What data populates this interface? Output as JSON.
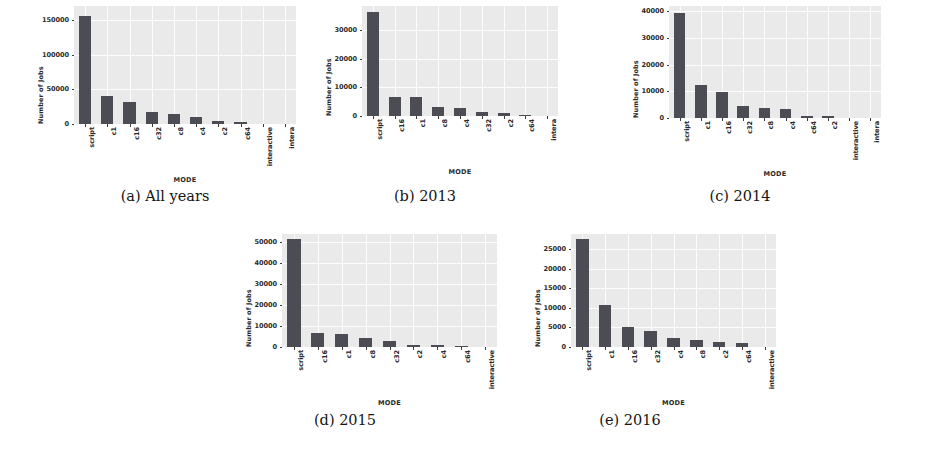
{
  "figure": {
    "panel_count": 5,
    "bar_color": "#4c4c54",
    "plot_background": "#eaeaea",
    "grid_color": "#fdfdfd",
    "text_color": "#2a2a2a"
  },
  "captions": {
    "a": "(a)  All years",
    "b": "(b)  2013",
    "c": "(c)  2014",
    "d": "(d)  2015",
    "e": "(e)  2016"
  },
  "axis_titles": {
    "y": "Number of Jobs",
    "x": "MODE"
  },
  "chart_data": [
    {
      "type": "bar",
      "title": "(a)  All years",
      "xlabel": "MODE",
      "ylabel": "Number of Jobs",
      "categories": [
        "script",
        "c1",
        "c16",
        "c32",
        "c8",
        "c4",
        "c2",
        "c64",
        "interactive",
        "intera"
      ],
      "values": [
        155000,
        40000,
        31000,
        17000,
        14000,
        10000,
        5000,
        2500,
        0,
        0
      ],
      "yticks": [
        0,
        50000,
        100000,
        150000
      ],
      "ytick_labels": [
        "0",
        "50000",
        "100000",
        "150000"
      ],
      "ylim": [
        0,
        170000
      ],
      "grid": true,
      "legend": "none"
    },
    {
      "type": "bar",
      "title": "(b)  2013",
      "xlabel": "MODE",
      "ylabel": "Number of Jobs",
      "categories": [
        "script",
        "c16",
        "c1",
        "c8",
        "c4",
        "c32",
        "c2",
        "c64",
        "intera"
      ],
      "values": [
        36500,
        6800,
        6700,
        3300,
        2900,
        1400,
        1100,
        500,
        0
      ],
      "yticks": [
        0,
        10000,
        20000,
        30000
      ],
      "ytick_labels": [
        "0",
        "10000",
        "20000",
        "30000"
      ],
      "ylim": [
        0,
        38500
      ],
      "grid": true,
      "legend": "none"
    },
    {
      "type": "bar",
      "title": "(c)  2014",
      "xlabel": "MODE",
      "ylabel": "Number of Jobs",
      "categories": [
        "script",
        "c1",
        "c16",
        "c32",
        "c8",
        "c4",
        "c64",
        "c2",
        "interactive",
        "intera"
      ],
      "values": [
        39500,
        12200,
        9600,
        4400,
        3700,
        3300,
        900,
        700,
        0,
        0
      ],
      "yticks": [
        0,
        10000,
        20000,
        30000,
        40000
      ],
      "ytick_labels": [
        "0",
        "10000",
        "20000",
        "30000",
        "40000"
      ],
      "ylim": [
        0,
        42000
      ],
      "grid": true,
      "legend": "none"
    },
    {
      "type": "bar",
      "title": "(d)  2015",
      "xlabel": "MODE",
      "ylabel": "Number of Jobs",
      "categories": [
        "script",
        "c16",
        "c1",
        "c8",
        "c32",
        "c2",
        "c4",
        "c64",
        "interactive"
      ],
      "values": [
        51500,
        6500,
        6200,
        4300,
        3100,
        900,
        800,
        700,
        0
      ],
      "yticks": [
        0,
        10000,
        20000,
        30000,
        40000,
        50000
      ],
      "ytick_labels": [
        "0",
        "10000",
        "20000",
        "30000",
        "40000",
        "50000"
      ],
      "ylim": [
        0,
        54000
      ],
      "grid": true,
      "legend": "none"
    },
    {
      "type": "bar",
      "title": "(e)  2016",
      "xlabel": "MODE",
      "ylabel": "Number of Jobs",
      "categories": [
        "script",
        "c1",
        "c16",
        "c32",
        "c4",
        "c8",
        "c2",
        "c64",
        "interactive"
      ],
      "values": [
        27500,
        10800,
        5200,
        4000,
        2200,
        1800,
        1400,
        900,
        0
      ],
      "yticks": [
        0,
        5000,
        10000,
        15000,
        20000,
        25000
      ],
      "ytick_labels": [
        "0",
        "5000",
        "10000",
        "15000",
        "20000",
        "25000"
      ],
      "ylim": [
        0,
        28800
      ],
      "grid": true,
      "legend": "none"
    }
  ],
  "panel_geometry": [
    {
      "id": "a",
      "left": 30,
      "top": 6,
      "plot_w": 222,
      "plot_h": 118,
      "cap_y": 188,
      "cap_w": 290,
      "cap_x": 20
    },
    {
      "id": "b",
      "left": 318,
      "top": 6,
      "plot_w": 196,
      "plot_h": 110,
      "cap_y": 188,
      "cap_w": 250,
      "cap_x": 300
    },
    {
      "id": "c",
      "left": 625,
      "top": 6,
      "plot_w": 212,
      "plot_h": 112,
      "cap_y": 188,
      "cap_w": 260,
      "cap_x": 610
    },
    {
      "id": "d",
      "left": 238,
      "top": 234,
      "plot_w": 215,
      "plot_h": 113,
      "cap_y": 412,
      "cap_w": 270,
      "cap_x": 210
    },
    {
      "id": "e",
      "left": 527,
      "top": 234,
      "plot_w": 205,
      "plot_h": 113,
      "cap_y": 412,
      "cap_w": 260,
      "cap_x": 500
    }
  ]
}
